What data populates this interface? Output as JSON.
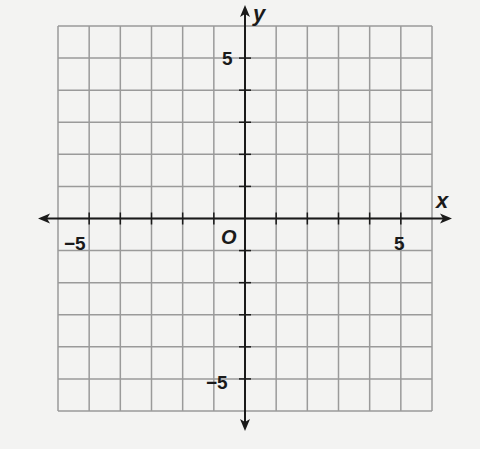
{
  "chart_data": {
    "type": "scatter",
    "title": "",
    "xlabel": "x",
    "ylabel": "y",
    "xlim": [
      -6,
      6
    ],
    "ylim": [
      -6,
      6
    ],
    "grid": true,
    "grid_step": 1,
    "origin_label": "O",
    "x_tick_labels": [
      {
        "value": -5,
        "label": "−5"
      },
      {
        "value": 5,
        "label": "5"
      }
    ],
    "y_tick_labels": [
      {
        "value": 5,
        "label": "5"
      },
      {
        "value": -5,
        "label": "−5"
      }
    ],
    "series": [],
    "colors": {
      "background": "#f3f3f2",
      "grid": "#9a9a9a",
      "axis": "#1a1a1a"
    }
  }
}
